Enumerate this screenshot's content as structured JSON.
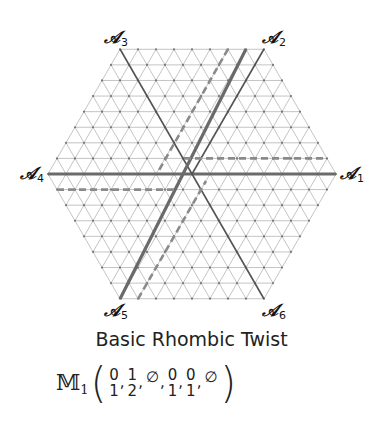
{
  "diagram": {
    "type": "triangular-lattice-hexagon",
    "center": [
      192,
      174
    ],
    "side_px": 144,
    "subdivisions": 8,
    "colors": {
      "grid": "#bdbdbd",
      "node": "#777777",
      "solid_axis": "#555555",
      "thick_line": "#6a6a6a",
      "dashed_line": "#8a8a8a"
    },
    "axes": [
      {
        "id": "A1",
        "symbol": "𝒜",
        "index": "1",
        "x": 340,
        "y": 165
      },
      {
        "id": "A2",
        "symbol": "𝒜",
        "index": "2",
        "x": 262,
        "y": 29
      },
      {
        "id": "A3",
        "symbol": "𝒜",
        "index": "3",
        "x": 104,
        "y": 29
      },
      {
        "id": "A4",
        "symbol": "𝒜",
        "index": "4",
        "x": 20,
        "y": 165
      },
      {
        "id": "A5",
        "symbol": "𝒜",
        "index": "5",
        "x": 104,
        "y": 302
      },
      {
        "id": "A6",
        "symbol": "𝒜",
        "index": "6",
        "x": 262,
        "y": 302
      }
    ],
    "lines": [
      {
        "name": "axis-a4-a1",
        "style": "solid",
        "width": 3,
        "from": [
          48,
          174
        ],
        "to": [
          336,
          174
        ]
      },
      {
        "name": "axis-a3-a6",
        "style": "solid",
        "width": 1.6,
        "from": [
          120,
          49
        ],
        "to": [
          264,
          299
        ]
      },
      {
        "name": "axis-a2-half",
        "style": "solid",
        "width": 1.6,
        "from": [
          264,
          49
        ],
        "to": [
          192,
          174
        ]
      },
      {
        "name": "twist-line-a5-a2",
        "style": "solid",
        "width": 3.2,
        "from": [
          120,
          299
        ],
        "to": [
          246,
          49
        ]
      },
      {
        "name": "dashed-horizontal-right",
        "style": "dashed",
        "width": 2.6,
        "from": [
          184,
          158.4
        ],
        "to": [
          327,
          158.4
        ]
      },
      {
        "name": "dashed-horizontal-left",
        "style": "dashed",
        "width": 2.6,
        "from": [
          57,
          189.6
        ],
        "to": [
          177,
          189.6
        ]
      },
      {
        "name": "dashed-diagonal-upper",
        "style": "dashed",
        "width": 2.6,
        "from": [
          228,
          49
        ],
        "to": [
          158,
          172
        ]
      },
      {
        "name": "dashed-diagonal-lower",
        "style": "dashed",
        "width": 2.6,
        "from": [
          138,
          299
        ],
        "to": [
          206,
          181
        ]
      }
    ]
  },
  "caption": "Basic Rhombic Twist",
  "formula": {
    "symbol": "𝕄",
    "index": "1",
    "open": "(",
    "close": ")",
    "entries": [
      {
        "top": "0",
        "bottom": "1"
      },
      {
        "top": "1",
        "bottom": "2"
      },
      {
        "top": "∅",
        "bottom": ""
      },
      {
        "top": "0",
        "bottom": "1"
      },
      {
        "top": "0",
        "bottom": "1"
      },
      {
        "top": "∅",
        "bottom": ""
      }
    ],
    "separator": ","
  }
}
